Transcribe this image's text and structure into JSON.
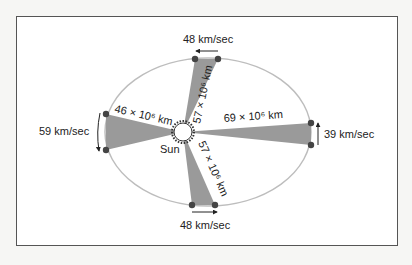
{
  "diagram": {
    "center_label": "Sun",
    "distances": {
      "perihelion": "46 × 10⁶ km",
      "aphelion": "69 × 10⁶ km",
      "top": "57 × 10⁶ km",
      "bottom": "57 × 10⁶ km"
    },
    "speeds": {
      "top": "48 km/sec",
      "left": "59 km/sec",
      "right": "39 km/sec",
      "bottom": "48 km/sec"
    },
    "colors": {
      "orbit": "#b8b8b8",
      "sector": "#999999",
      "planet": "#444444",
      "frame": "#555555"
    }
  }
}
